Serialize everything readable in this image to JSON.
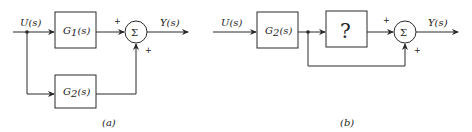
{
  "diagram_a": {
    "caption": "(a)",
    "input_label": "U(s)",
    "output_label": "Y(s)",
    "block_top": {
      "name": "G",
      "sub": "1",
      "arg": "(s)"
    },
    "block_bottom": {
      "name": "G",
      "sub": "2",
      "arg": "(s)"
    },
    "summer_symbol": "Σ",
    "sign_top": "+",
    "sign_bottom": "+"
  },
  "diagram_b": {
    "caption": "(b)",
    "input_label": "U(s)",
    "output_label": "Y(s)",
    "block_first": {
      "name": "G",
      "sub": "2",
      "arg": "(s)"
    },
    "block_unknown": "?",
    "summer_symbol": "Σ",
    "sign_top": "+",
    "sign_bottom": "+"
  },
  "colors": {
    "line": "#2a2a2a",
    "background": "#ffffff"
  }
}
